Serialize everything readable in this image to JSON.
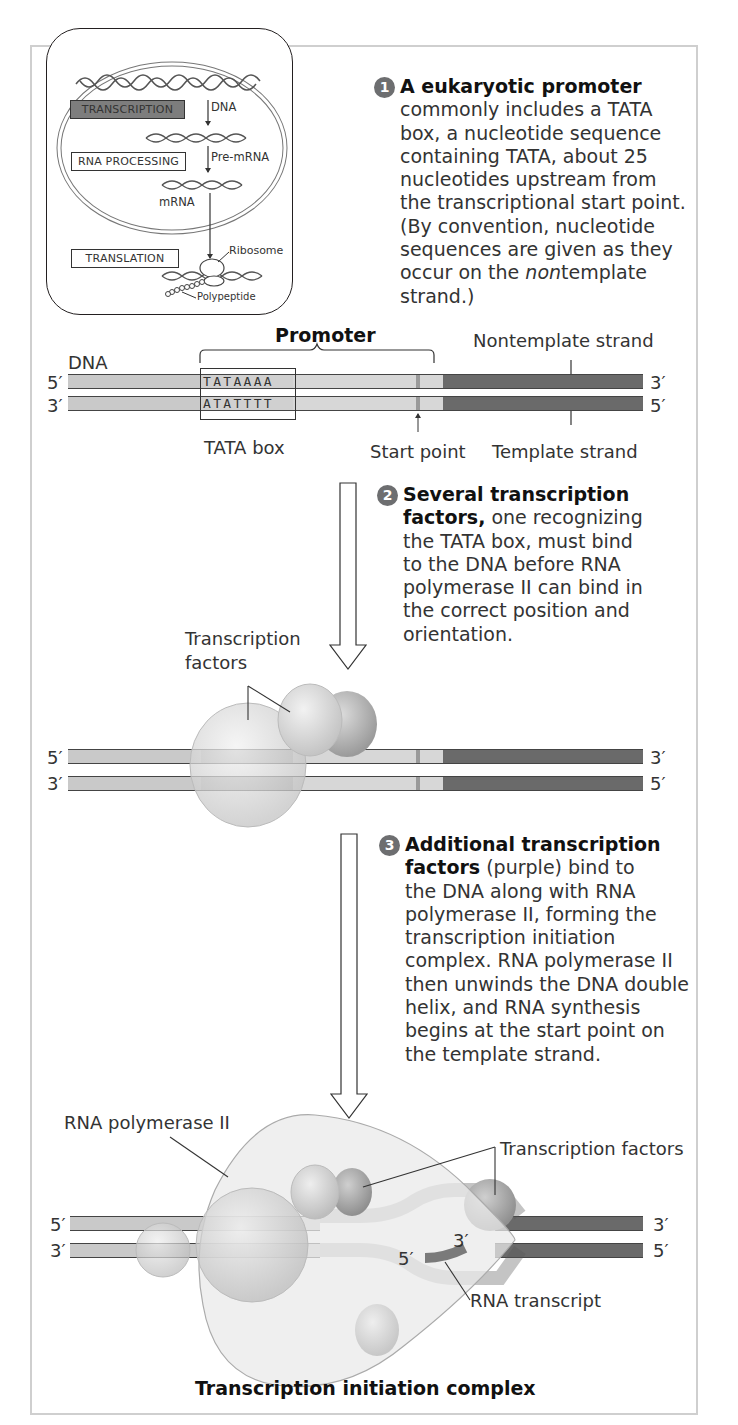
{
  "figure": {
    "title": "Transcription initiation complex",
    "colors": {
      "promoter_strand": "#c9c9c9",
      "tata_region": "#b5b5b5",
      "coding_region": "#6a6a6a",
      "start_mark": "#9a9a9a",
      "factor_light": "#d8d8d8",
      "factor_dark": "#a9a9a9"
    }
  },
  "overview_inset": {
    "steps": [
      "TRANSCRIPTION",
      "RNA PROCESSING",
      "TRANSLATION"
    ],
    "active_step": "TRANSCRIPTION",
    "molecules": {
      "dna": "DNA",
      "pre_mrna": "Pre-mRNA",
      "mrna": "mRNA",
      "ribosome": "Ribosome",
      "polypeptide": "Polypeptide"
    }
  },
  "step1": {
    "number": "1",
    "heading": "A eukaryotic promoter",
    "text_lines": [
      "commonly includes a TATA",
      "box, a nucleotide sequence",
      "containing TATA, about 25",
      "nucleotides upstream from",
      "the transcriptional start point.",
      "(By convention, nucleotide",
      "sequences are given as they",
      "occur on the "
    ],
    "italic_word": "non",
    "after_italic": "template",
    "last_line": "strand.)"
  },
  "panel1": {
    "promoter_label": "Promoter",
    "dna_label": "DNA",
    "nontemplate_label": "Nontemplate strand",
    "template_label": "Template strand",
    "tata_box_label": "TATA box",
    "start_point_label": "Start point",
    "top_seq": "TATAAAA",
    "bottom_seq": "ATATTTT",
    "top_left_end": "5′",
    "top_right_end": "3′",
    "bottom_left_end": "3′",
    "bottom_right_end": "5′"
  },
  "step2": {
    "number": "2",
    "heading_line1": "Several transcription",
    "heading_line2": "factors,",
    "rest_line2": " one recognizing",
    "text_lines": [
      "the TATA box, must bind",
      "to the DNA before RNA",
      "polymerase II can bind in",
      "the correct position and",
      "orientation."
    ]
  },
  "panel2": {
    "factors_label_line1": "Transcription",
    "factors_label_line2": "factors",
    "top_left_end": "5′",
    "top_right_end": "3′",
    "bottom_left_end": "3′",
    "bottom_right_end": "5′"
  },
  "step3": {
    "number": "3",
    "heading_line1": "Additional transcription",
    "heading_line2": "factors",
    "rest_line2": " (purple) bind to",
    "text_lines": [
      "the DNA along with RNA",
      "polymerase II, forming the",
      "transcription initiation",
      "complex. RNA polymerase II",
      "then unwinds the DNA double",
      "helix, and RNA synthesis",
      "begins at the start point on",
      "the template strand."
    ]
  },
  "panel3": {
    "polymerase_label": "RNA polymerase II",
    "factors_label": "Transcription factors",
    "rna_transcript_label": "RNA transcript",
    "rna_5_end": "5′",
    "rna_3_end": "3′",
    "top_left_end": "5′",
    "top_right_end": "3′",
    "bottom_left_end": "3′",
    "bottom_right_end": "5′",
    "caption": "Transcription initiation complex"
  }
}
